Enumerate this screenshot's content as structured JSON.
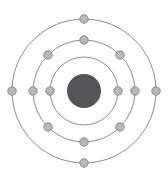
{
  "diagram": {
    "type": "bohr-atom",
    "canvas": {
      "width": 168,
      "height": 182,
      "background": "#ffffff"
    },
    "center": {
      "x": 84,
      "y": 91
    },
    "colors": {
      "nucleus_fill": "#555557",
      "ring_stroke": "#8e8e90",
      "electron_fill": "#b8b8ba",
      "electron_stroke": "#8c8c8e",
      "background": "#ffffff"
    },
    "nucleus": {
      "label": "nucleus",
      "cx": 84,
      "cy": 91,
      "radius": 17,
      "fill": "#555557"
    },
    "electron": {
      "radius": 4.2,
      "fill": "#b8b8ba",
      "stroke": "#8c8c8e"
    },
    "shells": [
      {
        "name": "K",
        "index": 1,
        "radius": 34,
        "electron_count": 2,
        "electrons": [
          {
            "x": 50,
            "y": 91
          },
          {
            "x": 118,
            "y": 91
          }
        ]
      },
      {
        "name": "L",
        "index": 2,
        "radius": 51,
        "electron_count": 8,
        "electrons": [
          {
            "x": 84,
            "y": 40
          },
          {
            "x": 120,
            "y": 55
          },
          {
            "x": 135,
            "y": 91
          },
          {
            "x": 120,
            "y": 127
          },
          {
            "x": 84,
            "y": 142
          },
          {
            "x": 48,
            "y": 127
          },
          {
            "x": 33,
            "y": 91
          },
          {
            "x": 48,
            "y": 55
          }
        ]
      },
      {
        "name": "M",
        "index": 3,
        "radius": 72,
        "electron_count": 4,
        "electrons": [
          {
            "x": 84,
            "y": 19
          },
          {
            "x": 156,
            "y": 91
          },
          {
            "x": 84,
            "y": 163
          },
          {
            "x": 12,
            "y": 91
          }
        ]
      }
    ],
    "electron_configuration": "2, 8, 4",
    "total_electrons": 14
  }
}
